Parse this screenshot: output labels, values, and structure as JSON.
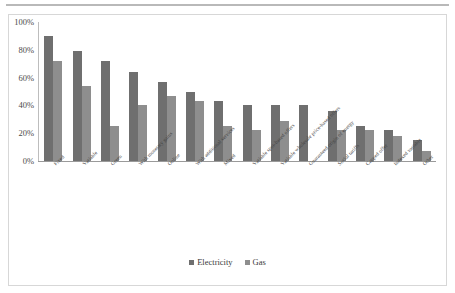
{
  "chart_data": {
    "type": "bar",
    "title": "",
    "subtitle": "",
    "xlabel": "",
    "ylabel": "",
    "ylim": [
      0,
      100
    ],
    "y_unit": "%",
    "grid": false,
    "legend_position": "bottom",
    "ytick_labels": [
      "100%",
      "80%",
      "60%",
      "40%",
      "20%",
      "0%"
    ],
    "ytick_values": [
      100,
      80,
      60,
      40,
      20,
      0
    ],
    "categories": [
      "Fixed",
      "Variable",
      "Green",
      "With monetary gains",
      "Online",
      "With additional services",
      "Mixed",
      "Variable spot-based offers",
      "Variable wholesale price-based offers",
      "Guaranteed origin of energy",
      "Social tariffs",
      "Capped offer",
      "Indexed variable",
      "Other"
    ],
    "series": [
      {
        "name": "Electricity",
        "color": "#6f6f6f",
        "values": [
          90,
          79,
          72,
          64,
          57,
          50,
          43,
          40,
          40,
          40,
          36,
          25,
          22,
          15
        ]
      },
      {
        "name": "Gas",
        "color": "#8e8e8e",
        "values": [
          72,
          54,
          25,
          40,
          47,
          43,
          25,
          22,
          29,
          null,
          22,
          22,
          18,
          7
        ]
      }
    ]
  },
  "legend": {
    "items": [
      {
        "label": "Electricity",
        "key": "electricity"
      },
      {
        "label": "Gas",
        "key": "gas"
      }
    ]
  }
}
